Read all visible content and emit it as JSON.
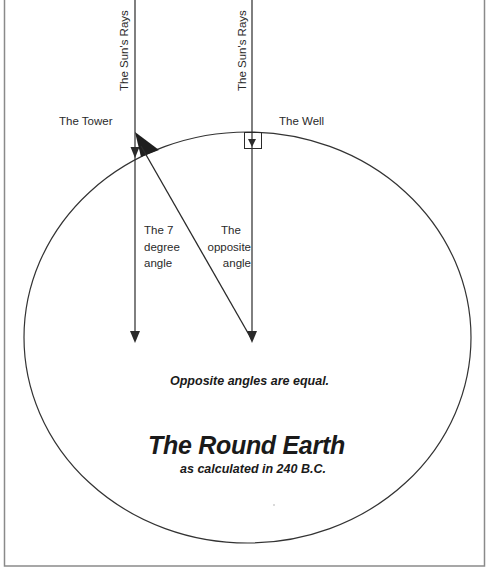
{
  "diagram": {
    "title": "The Round Earth",
    "subtitle": "as calculated in 240 B.C.",
    "statement": "Opposite angles are equal.",
    "rays": [
      {
        "label": "The Sun's Rays",
        "x": 135
      },
      {
        "label": "The Sun's Rays",
        "x": 252
      }
    ],
    "locations": {
      "tower": "The Tower",
      "well": "The Well"
    },
    "angles": {
      "seven_degree": [
        "The 7",
        "degree",
        "angle"
      ],
      "opposite": [
        "The",
        "opposite",
        "angle"
      ]
    },
    "colors": {
      "line": "#2a2a2a",
      "frame": "#8a8a8a",
      "background": "#ffffff"
    }
  }
}
